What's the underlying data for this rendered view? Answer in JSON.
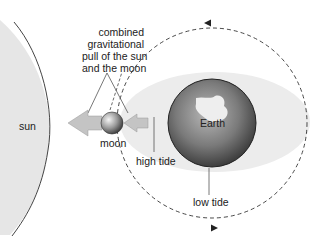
{
  "diagram": {
    "labels": {
      "sun": "sun",
      "moon": "moon",
      "earth": "Earth",
      "high_tide": "high tide",
      "low_tide": "low tide",
      "combined_pull_line1": "combined",
      "combined_pull_line2": "gravitational",
      "combined_pull_line3": "pull of the sun",
      "combined_pull_line4": "and the moon"
    },
    "colors": {
      "sun_fill": "#e6e6e6",
      "tidal_bulge": "#ececec",
      "arrow_fill": "#bdbdbd",
      "earth_dark": "#5a5a5a",
      "line": "#444444"
    },
    "orbit": {
      "direction": "counterclockwise",
      "style": "dashed"
    }
  }
}
